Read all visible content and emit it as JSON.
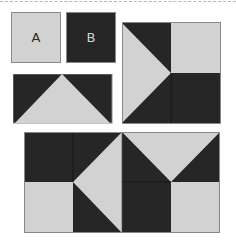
{
  "colors": {
    "dark": "#262626",
    "light": "#d2d2d2",
    "border": "#888888"
  },
  "pieces": {
    "a": {
      "label": "A",
      "color": "light"
    },
    "b": {
      "label": "B",
      "color": "dark"
    }
  },
  "blocks": {
    "triangle_rect": {
      "description": "dark rectangle with light upward triangle"
    },
    "right_square": {
      "description": "2x2 block: left-pointing light triangle, light top-right square, dark bottom-right"
    },
    "bottom_rect": {
      "description": "2x4 block composed of A and B pieces"
    }
  }
}
